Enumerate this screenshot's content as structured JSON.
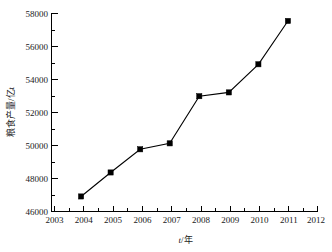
{
  "chart_data": {
    "type": "line",
    "title": "",
    "xlabel": "t/年",
    "ylabel": "粮食产量/亿t",
    "x": [
      2004,
      2005,
      2006,
      2007,
      2008,
      2009,
      2010,
      2011
    ],
    "values": [
      46910,
      48360,
      49760,
      50120,
      52970,
      53200,
      54900,
      57520
    ],
    "series": [
      {
        "name": "粮食产量",
        "values": [
          46910,
          48360,
          49760,
          50120,
          52970,
          53200,
          54900,
          57520
        ]
      }
    ],
    "xlim": [
      2003,
      2012
    ],
    "ylim": [
      46000,
      58000
    ],
    "xticks": [
      2003,
      2004,
      2005,
      2006,
      2007,
      2008,
      2009,
      2010,
      2011,
      2012
    ],
    "xtick_labels": [
      "2003",
      "2004",
      "2005",
      "2006",
      "2007",
      "2008",
      "2009",
      "2010",
      "2011",
      "2012"
    ],
    "yticks": [
      46000,
      48000,
      50000,
      52000,
      54000,
      56000,
      58000
    ],
    "ytick_labels": [
      "46000",
      "48000",
      "50000",
      "52000",
      "54000",
      "56000",
      "58000"
    ],
    "y_minor_step": 1000,
    "x_minor_step": 0.5,
    "grid": false,
    "legend": false,
    "legend_position": "none",
    "marker": "square",
    "marker_color": "#000000",
    "line_color": "#000000",
    "background_color": "#ffffff",
    "xlabel_parts": {
      "italic": "t",
      "rest": "/年"
    }
  }
}
